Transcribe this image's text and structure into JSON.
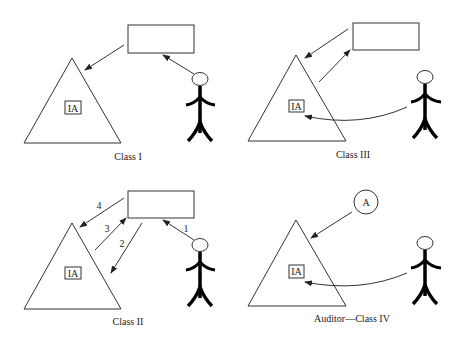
{
  "panels": [
    {
      "id": "class1",
      "label": "Class I",
      "box_label": "IA"
    },
    {
      "id": "class3",
      "label": "Class III",
      "box_label": "IA"
    },
    {
      "id": "class2",
      "label": "Class II",
      "box_label": "IA",
      "arrow_numbers": [
        "1",
        "2",
        "3",
        "4"
      ]
    },
    {
      "id": "class4",
      "label": "Auditor—Class IV",
      "box_label": "IA",
      "circle_label": "A"
    }
  ],
  "colors": {
    "stroke": "#333333",
    "figure": "#000000",
    "background": "#ffffff"
  }
}
